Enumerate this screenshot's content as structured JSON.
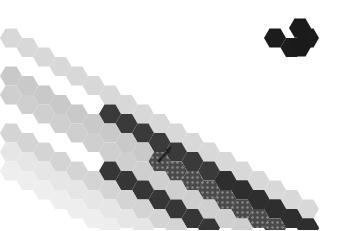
{
  "image": {
    "description": "Grayscale photo of a hexagon patchwork quilt forming diagonal stripes, with a small dark arrow pointing up-right",
    "width": 346,
    "height": 230
  },
  "grid": {
    "hex_width": 22,
    "hex_height": 19,
    "col_step": 16.5,
    "origin_x": 11,
    "origin_y": 76,
    "right_edge_col": 18
  },
  "stripes": [
    {
      "name": "stripe-top-right-dark",
      "start_col": 16,
      "cols": 3,
      "row_y": 38,
      "color": "#1c1c1c",
      "pattern": false
    },
    {
      "name": "stripe-1-light",
      "start_col": 0,
      "cols": 19,
      "row_y": 76,
      "color": "#d8d8d8",
      "pattern": false
    },
    {
      "name": "stripe-2-dark",
      "start_col": 6,
      "cols": 13,
      "row_y": 76,
      "offset_rows": 1,
      "color": "#3a3a3a",
      "pattern": false
    },
    {
      "name": "stripe-3-dark",
      "start_col": 13,
      "cols": 6,
      "row_y": 76,
      "offset_rows": 1,
      "color": "#2e2e2e",
      "pattern": false
    },
    {
      "name": "stripe-4-light",
      "start_col": 0,
      "cols": 19,
      "row_y": 76,
      "offset_rows": 2,
      "color": "#c9c9c9",
      "pattern": false
    },
    {
      "name": "stripe-5-dotted",
      "start_col": 9,
      "cols": 10,
      "row_y": 76,
      "offset_rows": 2,
      "color": "#555555",
      "pattern": true
    },
    {
      "name": "stripe-6-light",
      "start_col": 0,
      "cols": 19,
      "row_y": 76,
      "offset_rows": 3,
      "color": "#cfcfcf",
      "pattern": false
    },
    {
      "name": "stripe-7-dark",
      "start_col": 6,
      "cols": 13,
      "row_y": 76,
      "offset_rows": 4,
      "color": "#363636",
      "pattern": false
    },
    {
      "name": "stripe-8-light",
      "start_col": 0,
      "cols": 19,
      "row_y": 76,
      "offset_rows": 5,
      "color": "#d4d4d4",
      "pattern": false
    },
    {
      "name": "stripe-9-faint",
      "start_col": 0,
      "cols": 19,
      "row_y": 76,
      "offset_rows": 6,
      "color": "#e6e6e6",
      "pattern": false
    },
    {
      "name": "stripe-10-faintest",
      "start_col": 0,
      "cols": 19,
      "row_y": 76,
      "offset_rows": 7,
      "color": "#eeeeee",
      "pattern": false
    }
  ],
  "arrow": {
    "x1": 158,
    "y1": 162,
    "x2": 170,
    "y2": 149,
    "color": "#222222"
  }
}
